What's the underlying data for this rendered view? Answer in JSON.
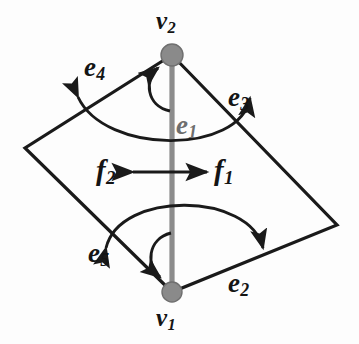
{
  "figure": {
    "type": "graph-diagram",
    "width": 359,
    "height": 344,
    "background_color": "#fdfdfd"
  },
  "colors": {
    "stroke": "#1a1a1a",
    "vertex_fill": "#8a8a8a",
    "vertex_stroke": "#6b6b6b",
    "edge_e1": "#8c8c8c",
    "label_dark": "#141414",
    "label_gray": "#6e6e6e"
  },
  "vertices": [
    {
      "id": "v2",
      "label": "v",
      "subscript": "2",
      "cx": 172,
      "cy": 55,
      "r": 11,
      "label_x": 156,
      "label_y": 8
    },
    {
      "id": "v1",
      "label": "v",
      "subscript": "1",
      "cx": 172,
      "cy": 292,
      "r": 10,
      "label_x": 156,
      "label_y": 305
    }
  ],
  "edges": [
    {
      "id": "e1",
      "label": "e",
      "subscript": "1",
      "label_x": 176,
      "label_y": 112,
      "color": "#8c8c8c",
      "note": "vertical gray edge from v2 to v1"
    },
    {
      "id": "e2",
      "label": "e",
      "subscript": "2",
      "label_x": 228,
      "label_y": 270,
      "color": "#141414",
      "note": "lower-right side of quadrilateral"
    },
    {
      "id": "e3",
      "label": "e",
      "subscript": "3",
      "label_x": 228,
      "label_y": 84,
      "color": "#141414",
      "note": "upper-right side of quadrilateral"
    },
    {
      "id": "e4",
      "label": "e",
      "subscript": "4",
      "label_x": 84,
      "label_y": 54,
      "color": "#141414",
      "note": "upper-left side of quadrilateral"
    },
    {
      "id": "e5",
      "label": "e",
      "subscript": "5",
      "label_x": 88,
      "label_y": 240,
      "color": "#141414",
      "note": "lower-left side of quadrilateral"
    }
  ],
  "faces": [
    {
      "id": "f1",
      "label": "f",
      "subscript": "1",
      "label_x": 214,
      "label_y": 156,
      "color": "#141414",
      "note": "right face, arrow points right"
    },
    {
      "id": "f2",
      "label": "f",
      "subscript": "2",
      "label_x": 96,
      "label_y": 156,
      "color": "#141414",
      "note": "left face, arrow points left"
    }
  ],
  "quadrilateral": {
    "points": "172,55 337,225 172,292 25,148",
    "corners": [
      {
        "name": "top",
        "x": 172,
        "y": 55
      },
      {
        "name": "right",
        "x": 337,
        "y": 225
      },
      {
        "name": "bottom",
        "x": 172,
        "y": 292
      },
      {
        "name": "left",
        "x": 25,
        "y": 148
      }
    ]
  },
  "rotation_arcs": [
    {
      "id": "arc-upper-wide",
      "from": "e4",
      "to": "e3",
      "direction": "double-headed",
      "apex_y": 147
    },
    {
      "id": "arc-lower-wide",
      "from": "e5",
      "to": "e2",
      "direction": "double-headed",
      "apex_y": 198
    },
    {
      "id": "arc-v2-small",
      "from": "e1",
      "to": "e4",
      "direction": "single-headed",
      "target": "v2"
    },
    {
      "id": "arc-v1-small",
      "from": "e1",
      "to": "e5",
      "direction": "single-headed",
      "target": "v1"
    }
  ],
  "face_arrow": {
    "id": "f-double-arrow",
    "y": 172,
    "x_left": 131,
    "x_right": 209,
    "direction": "double-headed-horizontal"
  }
}
